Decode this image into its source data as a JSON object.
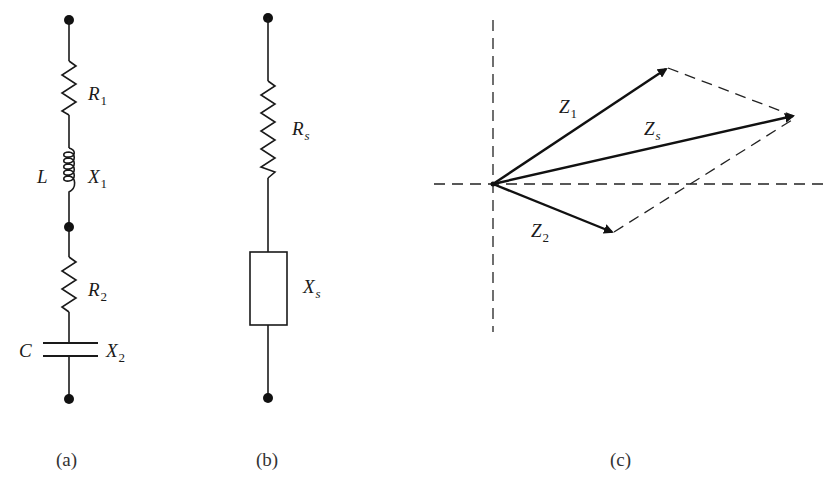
{
  "figure": {
    "panels": [
      {
        "id": "a",
        "caption": "(a)",
        "components": [
          {
            "type": "resistor",
            "symbol": "R",
            "subscript": "1"
          },
          {
            "type": "inductor",
            "name": "L",
            "symbol": "X",
            "subscript": "1"
          },
          {
            "type": "resistor",
            "symbol": "R",
            "subscript": "2"
          },
          {
            "type": "capacitor",
            "name": "C",
            "symbol": "X",
            "subscript": "2"
          }
        ]
      },
      {
        "id": "b",
        "caption": "(b)",
        "components": [
          {
            "type": "resistor",
            "symbol": "R",
            "subscript": "s"
          },
          {
            "type": "reactance-box",
            "symbol": "X",
            "subscript": "s"
          }
        ]
      },
      {
        "id": "c",
        "caption": "(c)",
        "vectors": [
          {
            "symbol": "Z",
            "subscript": "1"
          },
          {
            "symbol": "Z",
            "subscript": "s"
          },
          {
            "symbol": "Z",
            "subscript": "2"
          }
        ]
      }
    ]
  },
  "colors": {
    "ink": "#1a1a1a",
    "background": "#ffffff"
  }
}
